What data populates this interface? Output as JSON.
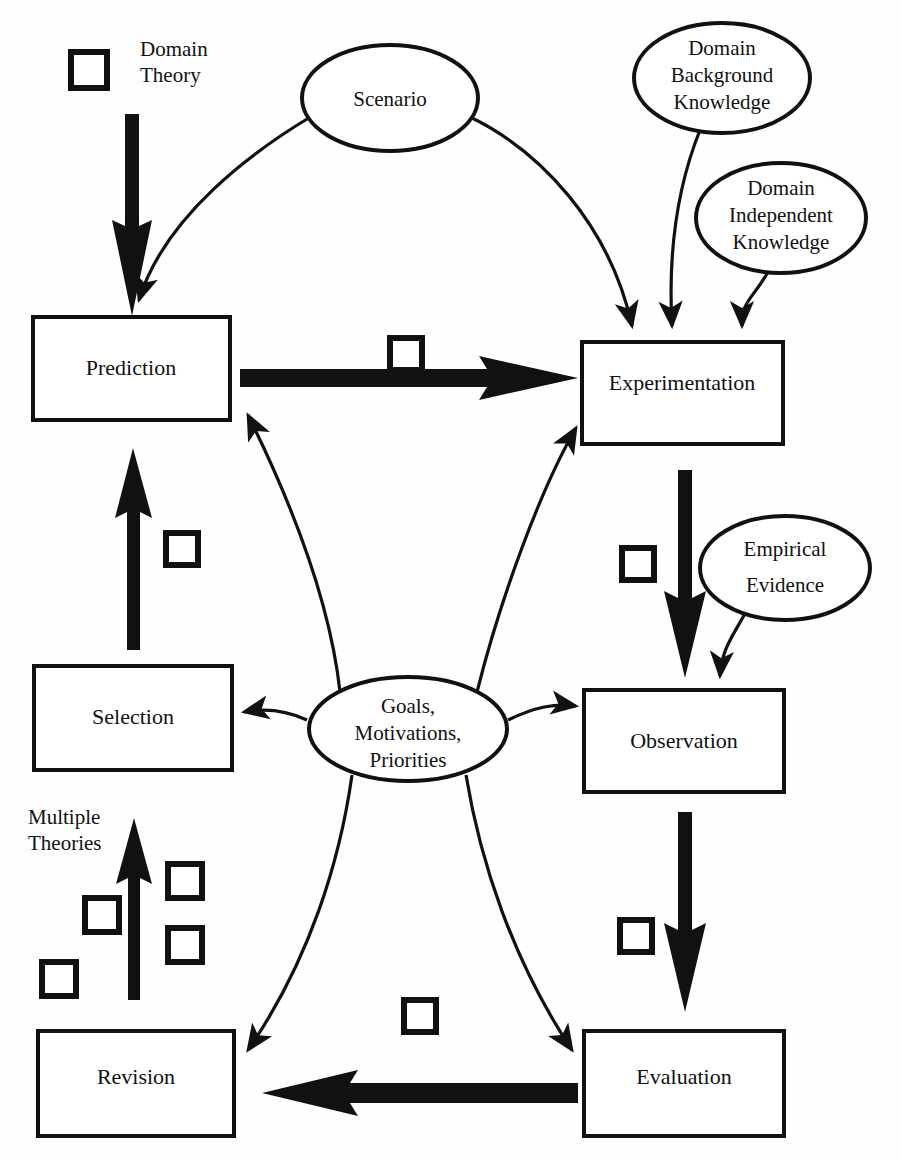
{
  "diagram": {
    "stroke_color": "#111111",
    "fill_color": "#ffffff",
    "background": "#fefefe",
    "process_boxes": [
      {
        "id": "prediction",
        "label": "Prediction",
        "x": 33,
        "y": 317,
        "w": 197,
        "h": 103
      },
      {
        "id": "experimentation",
        "label": "Experimentation",
        "x": 582,
        "y": 342,
        "w": 201,
        "h": 102
      },
      {
        "id": "selection",
        "label": "Selection",
        "x": 34,
        "y": 666,
        "w": 198,
        "h": 104
      },
      {
        "id": "observation",
        "label": "Observation",
        "x": 584,
        "y": 690,
        "w": 200,
        "h": 102
      },
      {
        "id": "revision",
        "label": "Revision",
        "x": 38,
        "y": 1031,
        "w": 196,
        "h": 105
      },
      {
        "id": "evaluation",
        "label": "Evaluation",
        "x": 584,
        "y": 1031,
        "w": 200,
        "h": 105
      }
    ],
    "knowledge_ellipses": [
      {
        "id": "scenario",
        "lines": [
          "Scenario"
        ],
        "cx": 390,
        "cy": 98,
        "rx": 88,
        "ry": 53
      },
      {
        "id": "domain-background-knowledge",
        "lines": [
          "Domain",
          "Background",
          "Knowledge"
        ],
        "cx": 722,
        "cy": 78,
        "rx": 88,
        "ry": 55
      },
      {
        "id": "domain-independent-knowledge",
        "lines": [
          "Domain",
          "Independent",
          "Knowledge"
        ],
        "cx": 781,
        "cy": 218,
        "rx": 85,
        "ry": 55
      },
      {
        "id": "empirical-evidence",
        "lines": [
          "Empirical",
          "Evidence"
        ],
        "cx": 785,
        "cy": 568,
        "rx": 85,
        "ry": 52
      },
      {
        "id": "goals-motivations-priorities",
        "lines": [
          "Goals,",
          "Motivations,",
          "Priorities"
        ],
        "cx": 408,
        "cy": 729,
        "rx": 99,
        "ry": 52
      }
    ],
    "free_labels": [
      {
        "id": "domain-theory",
        "lines": [
          "Domain",
          "Theory"
        ],
        "x": 140,
        "y": 56
      },
      {
        "id": "multiple-theories",
        "lines": [
          "Multiple",
          "Theories"
        ],
        "x": 28,
        "y": 824
      }
    ],
    "marker_squares": [
      {
        "id": "domain-theory-marker",
        "x": 71,
        "y": 52,
        "size": 36
      },
      {
        "id": "prediction-to-exp-marker",
        "x": 390,
        "y": 338,
        "size": 32
      },
      {
        "id": "selection-to-pred-marker",
        "x": 166,
        "y": 533,
        "size": 32
      },
      {
        "id": "experimentation-to-obs-marker",
        "x": 622,
        "y": 548,
        "size": 32
      },
      {
        "id": "theory-marker-a",
        "x": 168,
        "y": 864,
        "size": 34
      },
      {
        "id": "theory-marker-b",
        "x": 85,
        "y": 898,
        "size": 34
      },
      {
        "id": "theory-marker-c",
        "x": 168,
        "y": 928,
        "size": 34
      },
      {
        "id": "theory-marker-d",
        "x": 42,
        "y": 962,
        "size": 34
      },
      {
        "id": "observation-to-eval-marker",
        "x": 620,
        "y": 920,
        "size": 32
      },
      {
        "id": "evaluation-to-revision-marker",
        "x": 404,
        "y": 1000,
        "size": 32
      }
    ],
    "thick_arrows": [
      {
        "id": "domain-theory-to-prediction",
        "from": "Domain Theory",
        "to": "Prediction",
        "direction": "down"
      },
      {
        "id": "prediction-to-experimentation",
        "from": "Prediction",
        "to": "Experimentation",
        "direction": "right"
      },
      {
        "id": "selection-to-prediction",
        "from": "Selection",
        "to": "Prediction",
        "direction": "up"
      },
      {
        "id": "experimentation-to-observation",
        "from": "Experimentation",
        "to": "Observation",
        "direction": "down"
      },
      {
        "id": "multiple-theories-to-selection",
        "from": "Multiple Theories",
        "to": "Selection",
        "direction": "up"
      },
      {
        "id": "observation-to-evaluation",
        "from": "Observation",
        "to": "Evaluation",
        "direction": "down"
      },
      {
        "id": "evaluation-to-revision",
        "from": "Evaluation",
        "to": "Revision",
        "direction": "left"
      }
    ],
    "thin_links": [
      {
        "id": "scenario-to-prediction",
        "from": "Scenario",
        "to": "Prediction"
      },
      {
        "id": "scenario-to-experimentation",
        "from": "Scenario",
        "to": "Experimentation"
      },
      {
        "id": "dbk-to-experimentation",
        "from": "Domain Background Knowledge",
        "to": "Experimentation"
      },
      {
        "id": "dik-to-experimentation",
        "from": "Domain Independent Knowledge",
        "to": "Experimentation"
      },
      {
        "id": "evidence-to-observation",
        "from": "Empirical Evidence",
        "to": "Observation"
      },
      {
        "id": "goals-to-prediction",
        "from": "Goals, Motivations, Priorities",
        "to": "Prediction"
      },
      {
        "id": "goals-to-experimentation",
        "from": "Goals, Motivations, Priorities",
        "to": "Experimentation"
      },
      {
        "id": "goals-to-selection",
        "from": "Goals, Motivations, Priorities",
        "to": "Selection"
      },
      {
        "id": "goals-to-observation",
        "from": "Goals, Motivations, Priorities",
        "to": "Observation"
      },
      {
        "id": "goals-to-revision",
        "from": "Goals, Motivations, Priorities",
        "to": "Revision"
      },
      {
        "id": "goals-to-evaluation",
        "from": "Goals, Motivations, Priorities",
        "to": "Evaluation"
      }
    ]
  }
}
